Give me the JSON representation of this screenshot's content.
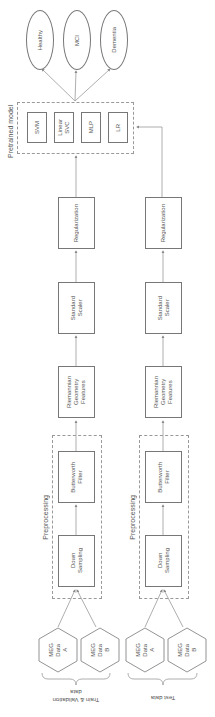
{
  "pretrained": {
    "title": "Pretrained model",
    "models": [
      "SVM",
      "Linear\nSVC",
      "MLP",
      "LR"
    ]
  },
  "outputs": [
    "Healthy",
    "MCI",
    "Dementia"
  ],
  "train": {
    "label": "Train & Validation\ndata",
    "regularization": "Regularization",
    "scaler": "Standard\nScaler",
    "features": "Riemannian\nGeometry\nFeatures",
    "butterworth": "Butterworth\nFilter",
    "downsampling": "Down\nSampling",
    "preprocessing": "Preprocessing",
    "data_a": "MEG\nData\nA",
    "data_b": "MEG\nData\nB"
  },
  "test": {
    "label": "Test data",
    "regularization": "Regularization",
    "scaler": "Standard\nScaler",
    "features": "Riemannian\nGeometry\nFeatures",
    "butterworth": "Butterworth\nFilter",
    "downsampling": "Down\nSampling",
    "preprocessing": "Preprocessing",
    "data_a": "MEG\nData\nA",
    "data_b": "MEG\nData\nB"
  },
  "colors": {
    "stroke": "#777777",
    "dashed": "#999999",
    "text": "#555555"
  }
}
